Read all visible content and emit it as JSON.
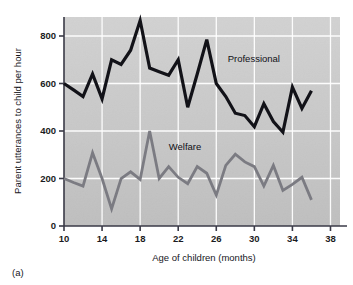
{
  "figure": {
    "panel_label": "(a)",
    "background_color": "#ffffff",
    "plot_background_color": "#c9c9c9",
    "gridline_color": "#ffffff",
    "axis_color": "#3a3a47"
  },
  "chart_data": {
    "type": "line",
    "title": "",
    "subtitle": "",
    "xlabel": "Age of children (months)",
    "ylabel": "Parent utterances to child per hour",
    "xlim": [
      10,
      39
    ],
    "ylim": [
      0,
      880
    ],
    "xticks": [
      10,
      14,
      18,
      22,
      26,
      30,
      34,
      38
    ],
    "xtick_labels": [
      "10",
      "14",
      "18",
      "22",
      "26",
      "30",
      "34",
      "38"
    ],
    "yticks": [
      0,
      200,
      400,
      600,
      800
    ],
    "ytick_labels": [
      "0",
      "200",
      "400",
      "600",
      "800"
    ],
    "grid": true,
    "grid_axes": "both",
    "legend_position": "inline-annotation",
    "x": [
      10,
      11,
      12,
      13,
      14,
      15,
      16,
      17,
      18,
      19,
      20,
      21,
      22,
      23,
      24,
      25,
      26,
      27,
      28,
      29,
      30,
      31,
      32,
      33,
      34,
      35,
      36
    ],
    "series": [
      {
        "name": "Professional",
        "color": "#121218",
        "line_width": 3.2,
        "label_x": 27.2,
        "label_y": 690,
        "values": [
          600,
          573,
          545,
          640,
          535,
          700,
          680,
          740,
          865,
          665,
          650,
          635,
          700,
          500,
          640,
          785,
          600,
          545,
          475,
          465,
          418,
          515,
          440,
          395,
          585,
          495,
          570
        ]
      },
      {
        "name": "Welfare",
        "color": "#7b7b82",
        "line_width": 2.8,
        "label_x": 21.0,
        "label_y": 318,
        "values": [
          200,
          183,
          168,
          308,
          200,
          72,
          200,
          228,
          196,
          400,
          200,
          250,
          205,
          178,
          250,
          222,
          130,
          255,
          302,
          270,
          250,
          168,
          255,
          150,
          175,
          205,
          110
        ]
      }
    ]
  }
}
